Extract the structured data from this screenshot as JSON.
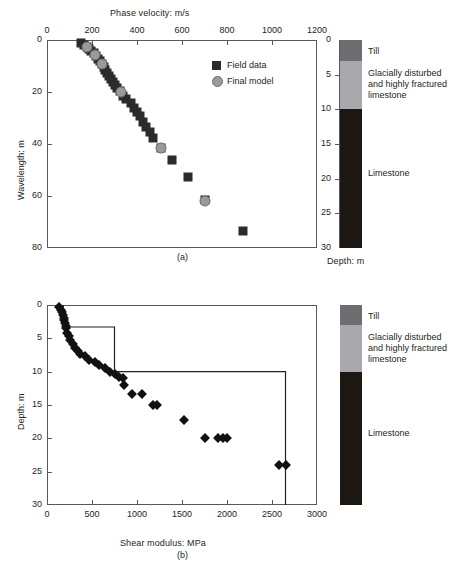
{
  "figure": {
    "panel_a_label": "(a)",
    "panel_b_label": "(b)"
  },
  "panel_a": {
    "x_axis": {
      "title": "Phase velocity: m/s",
      "min": 0,
      "max": 1200,
      "ticks": [
        0,
        200,
        400,
        600,
        800,
        1000,
        1200
      ],
      "position": "top"
    },
    "y_axis": {
      "title": "Wavelength: m",
      "min": 0,
      "max": 80,
      "ticks": [
        0,
        20,
        40,
        60,
        80
      ],
      "inverted": true
    },
    "legend": [
      {
        "label": "Field data",
        "marker": "square",
        "color": "#2b2b2b"
      },
      {
        "label": "Final model",
        "marker": "circle",
        "color": "#9a9a9a"
      }
    ]
  },
  "panel_b": {
    "x_axis": {
      "title": "Shear modulus: MPa",
      "min": 0,
      "max": 3000,
      "ticks": [
        0,
        500,
        1000,
        1500,
        2000,
        2500,
        3000
      ],
      "position": "bottom"
    },
    "y_axis": {
      "title": "Depth: m",
      "min": 0,
      "max": 30,
      "ticks": [
        0,
        5,
        10,
        15,
        20,
        25,
        30
      ],
      "inverted": true
    }
  },
  "geology": {
    "axis_title": "Depth: m",
    "axis_min": 0,
    "axis_max": 30,
    "axis_ticks": [
      0,
      5,
      10,
      15,
      20,
      25,
      30
    ],
    "layers": [
      {
        "name": "Till",
        "top": 0,
        "bottom": 3,
        "color": "#6d6e71",
        "label": "Till"
      },
      {
        "name": "weathered-limestone",
        "top": 3,
        "bottom": 10,
        "color": "#a7a9ac",
        "label": "Glacially disturbed\nand highly fractured\nlimestone"
      },
      {
        "name": "limestone",
        "top": 10,
        "bottom": 30,
        "color": "#1c1713",
        "label": "Limestone"
      }
    ]
  },
  "chart_data": [
    {
      "id": "dispersion-curve",
      "type": "scatter",
      "title": "",
      "xlabel": "Phase velocity: m/s",
      "ylabel": "Wavelength: m",
      "xlim": [
        0,
        1200
      ],
      "ylim": [
        0,
        80
      ],
      "y_inverted": true,
      "grid": false,
      "legend_position": "inner-top-right",
      "series": [
        {
          "name": "Field data",
          "marker": "square",
          "color": "#2b2b2b",
          "points": [
            [
              152,
              1.0
            ],
            [
              163,
              2.0
            ],
            [
              176,
              2.6
            ],
            [
              188,
              3.4
            ],
            [
              196,
              4.2
            ],
            [
              208,
              5.0
            ],
            [
              218,
              6.0
            ],
            [
              228,
              7.2
            ],
            [
              236,
              8.2
            ],
            [
              245,
              9.2
            ],
            [
              252,
              10.4
            ],
            [
              258,
              11.6
            ],
            [
              266,
              12.6
            ],
            [
              274,
              13.8
            ],
            [
              283,
              15.0
            ],
            [
              292,
              16.2
            ],
            [
              301,
              17.4
            ],
            [
              312,
              18.6
            ],
            [
              324,
              19.8
            ],
            [
              338,
              21.4
            ],
            [
              352,
              22.8
            ],
            [
              372,
              24.4
            ],
            [
              387,
              26.0
            ],
            [
              402,
              27.6
            ],
            [
              414,
              29.4
            ],
            [
              428,
              31.4
            ],
            [
              441,
              33.4
            ],
            [
              456,
              35.4
            ],
            [
              470,
              37.6
            ],
            [
              506,
              41.4
            ],
            [
              556,
              46.2
            ],
            [
              628,
              52.6
            ],
            [
              700,
              61.6
            ],
            [
              870,
              73.4
            ]
          ]
        },
        {
          "name": "Final model",
          "marker": "circle",
          "color": "#9a9a9a",
          "points": [
            [
              176,
              2.7
            ],
            [
              214,
              5.6
            ],
            [
              246,
              9.4
            ],
            [
              330,
              19.9
            ],
            [
              505,
              41.6
            ],
            [
              700,
              62.0
            ]
          ]
        }
      ]
    },
    {
      "id": "shear-modulus-profile",
      "type": "scatter",
      "title": "",
      "xlabel": "Shear modulus: MPa",
      "ylabel": "Depth: m",
      "xlim": [
        0,
        3000
      ],
      "ylim": [
        0,
        30
      ],
      "y_inverted": true,
      "grid": false,
      "series": [
        {
          "name": "Inverted shear modulus",
          "marker": "diamond",
          "color": "#111111",
          "points": [
            [
              130,
              0.3
            ],
            [
              150,
              0.7
            ],
            [
              163,
              1.1
            ],
            [
              175,
              1.5
            ],
            [
              185,
              1.9
            ],
            [
              192,
              2.3
            ],
            [
              200,
              2.7
            ],
            [
              208,
              3.1
            ],
            [
              214,
              3.5
            ],
            [
              226,
              4.2
            ],
            [
              240,
              4.7
            ],
            [
              260,
              5.3
            ],
            [
              286,
              5.9
            ],
            [
              312,
              6.4
            ],
            [
              340,
              6.9
            ],
            [
              372,
              7.4
            ],
            [
              418,
              7.6
            ],
            [
              470,
              8.2
            ],
            [
              530,
              8.6
            ],
            [
              580,
              9.0
            ],
            [
              640,
              9.4
            ],
            [
              700,
              10.0
            ],
            [
              760,
              10.4
            ],
            [
              800,
              10.8
            ],
            [
              840,
              11.0
            ],
            [
              860,
              12.0
            ],
            [
              940,
              13.4
            ],
            [
              1050,
              13.4
            ],
            [
              1180,
              15.0
            ],
            [
              1220,
              15.0
            ],
            [
              1520,
              17.2
            ],
            [
              1760,
              20.0
            ],
            [
              1900,
              20.0
            ],
            [
              1950,
              20.0
            ],
            [
              2000,
              20.0
            ],
            [
              2580,
              24.0
            ],
            [
              2660,
              24.0
            ]
          ]
        },
        {
          "name": "Layered model",
          "type": "step",
          "color": "#231f20",
          "steps": [
            {
              "modulus": 180,
              "top": 0,
              "bottom": 3.3
            },
            {
              "modulus": 750,
              "top": 3.3,
              "bottom": 10.0
            },
            {
              "modulus": 2650,
              "top": 10.0,
              "bottom": 30.0
            }
          ]
        }
      ]
    }
  ]
}
